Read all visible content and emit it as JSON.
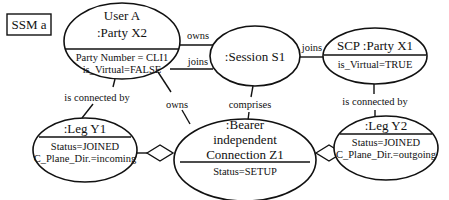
{
  "diagram": {
    "title": "SSM a",
    "nodes": {
      "user_a": {
        "name_line1": "User A",
        "name_line2": ":Party X2",
        "attr1": "Party Number = CLI1",
        "attr2": "is_Virtual=FALSE"
      },
      "session": {
        "name": ":Session S1"
      },
      "scp": {
        "name": "SCP :Party X1",
        "attr1": "is_Virtual=TRUE"
      },
      "leg_y1": {
        "name": ":Leg Y1",
        "attr1": "Status=JOINED",
        "attr2": "C_Plane_Dir.=incoming"
      },
      "bearer": {
        "name_line1": ":Bearer",
        "name_line2": "independent",
        "name_line3": "Connection Z1",
        "attr1": "Status=SETUP"
      },
      "leg_y2": {
        "name": ":Leg Y2",
        "attr1": "Status=JOINED",
        "attr2": "C_Plane_Dir.=outgoing"
      }
    },
    "relations": {
      "owns_session": "owns",
      "joins_session": "joins",
      "scp_joins": "joins",
      "user_connected": "is connected by",
      "scp_connected": "is connected by",
      "owns_bearer": "owns",
      "comprises": "comprises"
    }
  }
}
